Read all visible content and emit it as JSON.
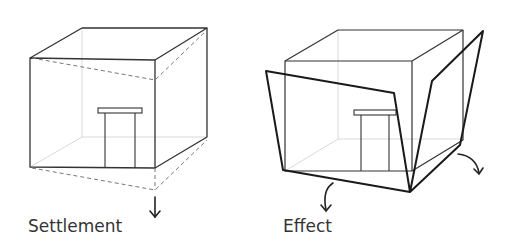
{
  "panels": [
    {
      "id": "settlement",
      "caption": "Settlement",
      "description": "Cube building with door; dashed outline shows front-right corner sinking downward",
      "arrow": "straight-down-arrow"
    },
    {
      "id": "effect",
      "caption": "Effect",
      "description": "Cube building with door; front and right walls tilt outward from the sunken corner",
      "arrows": [
        "curved-down-left-arrow",
        "curved-down-right-arrow"
      ]
    }
  ],
  "colors": {
    "line": "#333333",
    "bold_line": "#1a1a1a",
    "hidden_line": "#c8c8c8",
    "dashed_line": "#666666",
    "background": "#ffffff"
  }
}
